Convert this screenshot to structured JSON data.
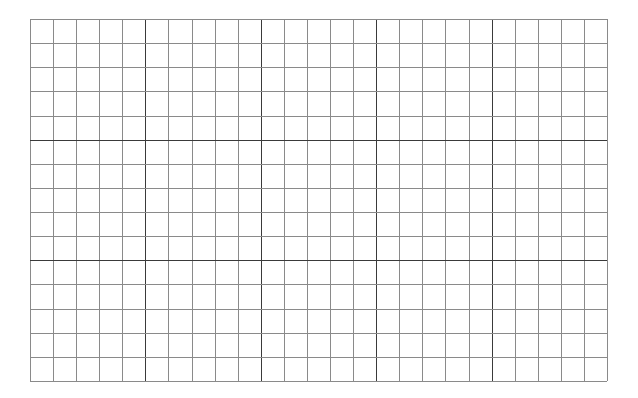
{
  "grid": {
    "left": 30,
    "top": 19,
    "right": 607,
    "bottom": 381,
    "columns": 25,
    "rows": 15,
    "major_every": 5,
    "minor_color": "#8a8a8a",
    "major_color": "#3a3a3a",
    "minor_width": 1,
    "major_width": 1.4
  }
}
